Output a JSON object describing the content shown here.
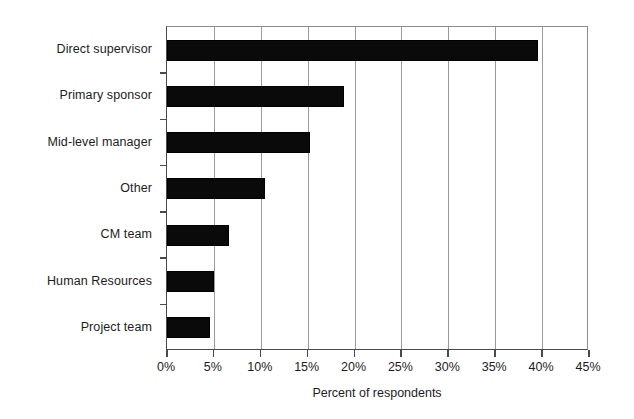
{
  "chart_data": {
    "type": "bar",
    "orientation": "horizontal",
    "title": "",
    "subtitle": "",
    "xlabel": "Percent of respondents",
    "ylabel": "",
    "categories": [
      "Direct supervisor",
      "Primary sponsor",
      "Mid-level manager",
      "Other",
      "CM team",
      "Human Resources",
      "Project team"
    ],
    "values": [
      39.6,
      18.9,
      15.2,
      10.4,
      6.6,
      5.0,
      4.6
    ],
    "value_unit": "%",
    "xlim": [
      0,
      45
    ],
    "xtick_values": [
      0,
      5,
      10,
      15,
      20,
      25,
      30,
      35,
      40,
      45
    ],
    "xtick_labels": [
      "0%",
      "5%",
      "10%",
      "15%",
      "20%",
      "25%",
      "30%",
      "35%",
      "40%",
      "45%"
    ],
    "grid": "vertical",
    "legend": "none",
    "bar_color": "#0a0a0a",
    "axis_color": "#4a4a4a",
    "gridline_color": "#9a9a9a",
    "background_color": "#ffffff"
  }
}
